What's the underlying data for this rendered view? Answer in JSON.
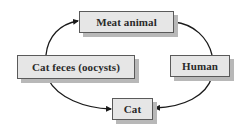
{
  "diagram": {
    "type": "cycle",
    "nodes": {
      "meat_animal": {
        "label": "Meat animal"
      },
      "cat_feces": {
        "label": "Cat feces (oocysts)"
      },
      "human": {
        "label": "Human"
      },
      "cat": {
        "label": "Cat"
      }
    },
    "edges": [
      {
        "from": "Cat feces (oocysts)",
        "to": "Meat animal",
        "arrow": true
      },
      {
        "from": "Meat animal",
        "to": "Human",
        "arrow": false
      },
      {
        "from": "Cat feces (oocysts)",
        "to": "Cat",
        "arrow": true
      },
      {
        "from": "Human",
        "to": "Cat",
        "arrow": true
      }
    ],
    "colors": {
      "box_fill": "#e6e6e6",
      "box_border": "#5a5a5a",
      "shadow": "#b8b8b8",
      "arrow": "#1a1a1a",
      "text": "#2a2a2a"
    }
  }
}
